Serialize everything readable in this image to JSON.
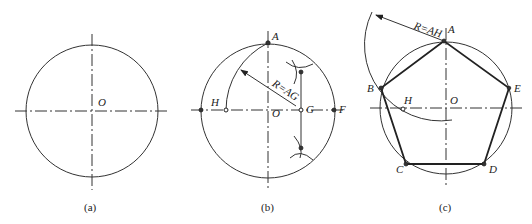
{
  "figure": {
    "panels": [
      {
        "id": "a",
        "caption": "(a)",
        "center_label": "O"
      },
      {
        "id": "b",
        "caption": "(b)",
        "labels": {
          "A": "A",
          "H": "H",
          "O": "O",
          "G": "G",
          "F": "F"
        },
        "radius_note": "R=AG"
      },
      {
        "id": "c",
        "caption": "(c)",
        "labels": {
          "A": "A",
          "B": "B",
          "C": "C",
          "D": "D",
          "E": "E",
          "H": "H",
          "O": "O"
        },
        "radius_note": "R=AH"
      }
    ]
  }
}
